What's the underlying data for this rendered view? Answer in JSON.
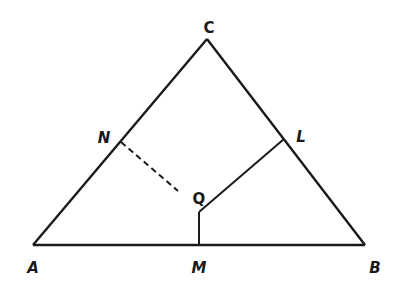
{
  "figure": {
    "type": "triangle-diagram",
    "colors": {
      "stroke": "#1a1a1a",
      "background": "#ffffff"
    },
    "points": {
      "A": {
        "label": "A"
      },
      "B": {
        "label": "B"
      },
      "C": {
        "label": "C"
      },
      "M": {
        "label": "M"
      },
      "N": {
        "label": "N"
      },
      "L": {
        "label": "L"
      },
      "Q": {
        "label": "Q"
      }
    },
    "segments": [
      {
        "from": "A",
        "to": "B",
        "style": "solid"
      },
      {
        "from": "B",
        "to": "C",
        "style": "solid"
      },
      {
        "from": "C",
        "to": "A",
        "style": "solid"
      },
      {
        "from": "Q",
        "to": "L",
        "style": "solid"
      },
      {
        "from": "Q",
        "to": "M",
        "style": "solid"
      },
      {
        "from": "N",
        "to": "Q",
        "style": "dashed"
      }
    ]
  }
}
